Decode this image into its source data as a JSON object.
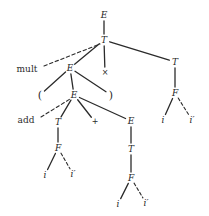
{
  "figure": {
    "kind": "parse-tree",
    "background": "#ffffff",
    "ink": "#2b2b2b",
    "width": 209,
    "height": 216
  },
  "nodes": [
    {
      "id": "n0",
      "label": "E",
      "x": 104,
      "y": 15,
      "style": "italic"
    },
    {
      "id": "n1",
      "label": "T",
      "x": 104,
      "y": 40,
      "style": "italic"
    },
    {
      "id": "n2",
      "label": "E",
      "x": 70,
      "y": 68,
      "style": "italic"
    },
    {
      "id": "n3",
      "label": "×",
      "x": 105,
      "y": 73,
      "style": "op"
    },
    {
      "id": "n4",
      "label": "T",
      "x": 175,
      "y": 62,
      "style": "italic"
    },
    {
      "id": "n5",
      "label": "(",
      "x": 40,
      "y": 95,
      "style": "paren"
    },
    {
      "id": "n6",
      "label": "E",
      "x": 74,
      "y": 95,
      "style": "italic"
    },
    {
      "id": "n7",
      "label": ")",
      "x": 111,
      "y": 95,
      "style": "paren"
    },
    {
      "id": "n8",
      "label": "T",
      "x": 58,
      "y": 122,
      "style": "italic"
    },
    {
      "id": "n9",
      "label": "+",
      "x": 95,
      "y": 122,
      "style": "op"
    },
    {
      "id": "n10",
      "label": "E",
      "x": 131,
      "y": 121,
      "style": "italic"
    },
    {
      "id": "n11",
      "label": "F",
      "x": 175,
      "y": 93,
      "style": "italic"
    },
    {
      "id": "n12",
      "label": "i",
      "x": 163,
      "y": 120,
      "style": "italic"
    },
    {
      "id": "n13",
      "label": "i′",
      "x": 192,
      "y": 120,
      "style": "italic"
    },
    {
      "id": "n14",
      "label": "F",
      "x": 58,
      "y": 148,
      "style": "italic"
    },
    {
      "id": "n15",
      "label": "i",
      "x": 45,
      "y": 175,
      "style": "italic"
    },
    {
      "id": "n16",
      "label": "i′",
      "x": 73,
      "y": 174,
      "style": "italic"
    },
    {
      "id": "n17",
      "label": "T",
      "x": 131,
      "y": 149,
      "style": "italic"
    },
    {
      "id": "n18",
      "label": "F",
      "x": 131,
      "y": 178,
      "style": "italic"
    },
    {
      "id": "n19",
      "label": "i",
      "x": 118,
      "y": 204,
      "style": "italic"
    },
    {
      "id": "n20",
      "label": "i′",
      "x": 146,
      "y": 203,
      "style": "italic"
    }
  ],
  "edges": [
    {
      "from": "n0",
      "to": "n1",
      "kind": "solid"
    },
    {
      "from": "n1",
      "to": "n2",
      "kind": "solid"
    },
    {
      "from": "n1",
      "to": "n3",
      "kind": "solid"
    },
    {
      "from": "n1",
      "to": "n4",
      "kind": "solid"
    },
    {
      "from": "n2",
      "to": "n5",
      "kind": "solid"
    },
    {
      "from": "n2",
      "to": "n6",
      "kind": "solid"
    },
    {
      "from": "n2",
      "to": "n7",
      "kind": "solid"
    },
    {
      "from": "n6",
      "to": "n8",
      "kind": "solid"
    },
    {
      "from": "n6",
      "to": "n9",
      "kind": "solid"
    },
    {
      "from": "n6",
      "to": "n10",
      "kind": "solid"
    },
    {
      "from": "n4",
      "to": "n11",
      "kind": "solid"
    },
    {
      "from": "n11",
      "to": "n12",
      "kind": "solid"
    },
    {
      "from": "n11",
      "to": "n13",
      "kind": "dashed"
    },
    {
      "from": "n8",
      "to": "n14",
      "kind": "solid"
    },
    {
      "from": "n14",
      "to": "n15",
      "kind": "solid"
    },
    {
      "from": "n14",
      "to": "n16",
      "kind": "dashed"
    },
    {
      "from": "n10",
      "to": "n17",
      "kind": "solid"
    },
    {
      "from": "n17",
      "to": "n18",
      "kind": "solid"
    },
    {
      "from": "n18",
      "to": "n19",
      "kind": "solid"
    },
    {
      "from": "n18",
      "to": "n20",
      "kind": "dashed"
    }
  ],
  "annotations": [
    {
      "id": "a-mult",
      "label": "mult",
      "x": 27,
      "y": 69,
      "leader": {
        "x1": 44,
        "y1": 66,
        "x2": 100,
        "y2": 44
      },
      "kind": "dashed"
    },
    {
      "id": "a-add",
      "label": "add",
      "x": 26,
      "y": 120,
      "leader": {
        "x1": 41,
        "y1": 117,
        "x2": 70,
        "y2": 99
      },
      "kind": "dashed"
    }
  ]
}
